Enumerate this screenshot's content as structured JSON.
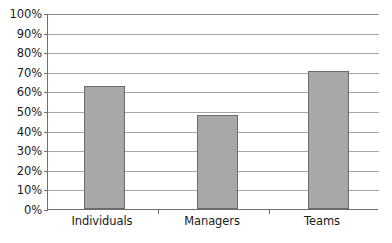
{
  "chart_data": {
    "type": "bar",
    "title": "",
    "subtitle": "",
    "xlabel": "",
    "ylabel": "",
    "categories": [
      "Individuals",
      "Managers",
      "Teams"
    ],
    "values": [
      63,
      48,
      71
    ],
    "series": [
      {
        "name": "",
        "values": [
          63,
          48,
          71
        ]
      }
    ],
    "ylim": [
      0,
      100
    ],
    "y_tick_values": [
      100,
      90,
      80,
      70,
      60,
      50,
      40,
      30,
      20,
      10,
      0
    ],
    "y_tick_labels": [
      "100%",
      "90%",
      "80%",
      "70%",
      "60%",
      "50%",
      "40%",
      "30%",
      "20%",
      "10%",
      "0%"
    ],
    "value_format": "percent",
    "grid": true,
    "grid_axis": "y",
    "legend": false,
    "legend_position": "none",
    "annotations": []
  },
  "style": {
    "bar_fill": "#a8a8a8",
    "bar_border": "#6b6b6b",
    "gridline_color": "#a6a6a6",
    "axis_color": "#6e6e6e",
    "text_color": "#1a1a1a",
    "background": "#ffffff"
  }
}
